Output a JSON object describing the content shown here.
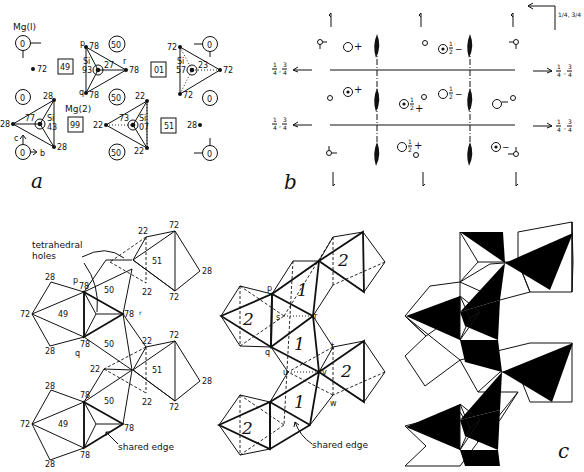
{
  "figure": {
    "panel_labels": {
      "a": "a",
      "b": "b",
      "c": "c"
    }
  },
  "panel_a": {
    "mg1_label": "Mg(l)",
    "mg2_label": "Mg(2)",
    "axis_c": "c",
    "axis_b": "b",
    "si_label": "Si",
    "circles": [
      "0",
      "0",
      "0",
      "0",
      "0",
      "0",
      "50",
      "50",
      "50",
      "50"
    ],
    "squares": [
      "49",
      "01",
      "99",
      "51"
    ],
    "tetra1": {
      "si": "93",
      "center_val": "27",
      "p": "p",
      "q": "q",
      "r": "r",
      "v1": "78",
      "v2": "78",
      "v3": "78"
    },
    "tetra2": {
      "si": "57",
      "center_val": "23",
      "v1": "72",
      "v2": "72",
      "v3": "72"
    },
    "tetra3": {
      "si": "43",
      "center_val": "77",
      "v1": "28",
      "v2": "28",
      "v3": "28"
    },
    "tetra4": {
      "si": "07",
      "center_val": "73",
      "v1": "22",
      "v2": "22",
      "v3": "22"
    },
    "loose": {
      "o72": "72",
      "o28": "28"
    }
  },
  "panel_b": {
    "corner_label": "1/4, 3/4",
    "quarter": "1",
    "three_quarter": "3",
    "four": "4",
    "half_num": "1",
    "half_den": "2",
    "plus": "+",
    "minus": "−"
  },
  "panel_d": {
    "tetrahedral_holes": "tetrahedral",
    "holes": "holes",
    "shared_edge": "shared  edge",
    "labels": {
      "p": "p",
      "q": "q",
      "r": "r",
      "v28": "28",
      "v72": "72",
      "v78": "78",
      "v22": "22",
      "m49": "49",
      "m50": "50",
      "m51": "51"
    }
  },
  "panel_e": {
    "shared_edge": "shared  edge",
    "labels": {
      "p": "p",
      "q": "q",
      "r": "r",
      "s": "s",
      "t": "t",
      "u": "u",
      "v": "v",
      "w": "w",
      "one": "1",
      "two": "2"
    }
  }
}
